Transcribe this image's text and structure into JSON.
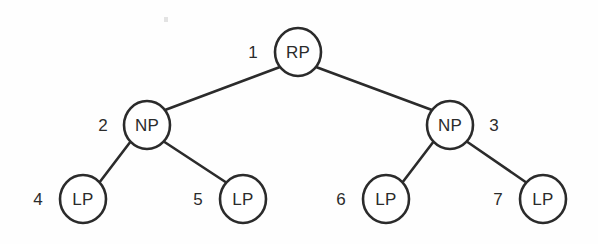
{
  "diagram": {
    "type": "binary-tree",
    "title": "",
    "background_color": "#fefefe",
    "line_color": "#2b2b2b",
    "node_fill_color": "#ffffff",
    "node_radius": 23,
    "levels": 3,
    "nodes": [
      {
        "id": "root",
        "label": "RP",
        "index": "1",
        "cx": 298,
        "cy": 52,
        "index_x": 253,
        "index_y": 52,
        "index_anchor": "middle",
        "index_side": "left"
      },
      {
        "id": "np-l",
        "label": "NP",
        "index": "2",
        "cx": 147,
        "cy": 125,
        "index_x": 103,
        "index_y": 125,
        "index_anchor": "middle",
        "index_side": "left"
      },
      {
        "id": "np-r",
        "label": "NP",
        "index": "3",
        "cx": 450,
        "cy": 125,
        "index_x": 494,
        "index_y": 125,
        "index_anchor": "middle",
        "index_side": "right"
      },
      {
        "id": "lp-1",
        "label": "LP",
        "index": "4",
        "cx": 83,
        "cy": 199,
        "index_x": 38,
        "index_y": 199,
        "index_anchor": "middle",
        "index_side": "left"
      },
      {
        "id": "lp-2",
        "label": "LP",
        "index": "5",
        "cx": 243,
        "cy": 199,
        "index_x": 198,
        "index_y": 199,
        "index_anchor": "middle",
        "index_side": "left"
      },
      {
        "id": "lp-3",
        "label": "LP",
        "index": "6",
        "cx": 386,
        "cy": 199,
        "index_x": 341,
        "index_y": 199,
        "index_anchor": "middle",
        "index_side": "left"
      },
      {
        "id": "lp-4",
        "label": "LP",
        "index": "7",
        "cx": 543,
        "cy": 199,
        "index_x": 498,
        "index_y": 199,
        "index_anchor": "middle",
        "index_side": "left"
      }
    ],
    "edges": [
      {
        "from": "root",
        "to": "np-l",
        "x1": 280,
        "y1": 67,
        "x2": 165,
        "y2": 110
      },
      {
        "from": "root",
        "to": "np-r",
        "x1": 316,
        "y1": 67,
        "x2": 432,
        "y2": 110
      },
      {
        "from": "np-l",
        "to": "lp-1",
        "x1": 131,
        "y1": 141,
        "x2": 99,
        "y2": 183
      },
      {
        "from": "np-l",
        "to": "lp-2",
        "x1": 163,
        "y1": 141,
        "x2": 227,
        "y2": 183
      },
      {
        "from": "np-r",
        "to": "lp-3",
        "x1": 434,
        "y1": 141,
        "x2": 402,
        "y2": 183
      },
      {
        "from": "np-r",
        "to": "lp-4",
        "x1": 466,
        "y1": 141,
        "x2": 527,
        "y2": 183
      }
    ],
    "artifact": {
      "name": "scan-speck",
      "x": 164,
      "y": 17
    }
  }
}
